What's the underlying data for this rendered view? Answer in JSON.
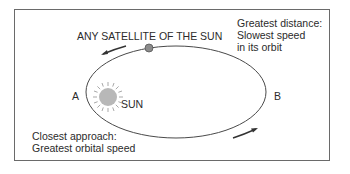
{
  "diagram": {
    "title": "ANY SATELLITE OF THE SUN",
    "far_note": [
      "Greatest distance:",
      "Slowest speed",
      "in its orbit"
    ],
    "near_note": [
      "Closest approach:",
      "Greatest orbital speed"
    ],
    "point_a": "A",
    "point_b": "B",
    "sun_label": "SUN",
    "colors": {
      "orbit": "#4a4a4a",
      "sun_fill": "#b8b8b8",
      "satellite_fill": "#8c8c8c",
      "frame": "#6a6a6a",
      "text": "#2b2b2b"
    }
  }
}
